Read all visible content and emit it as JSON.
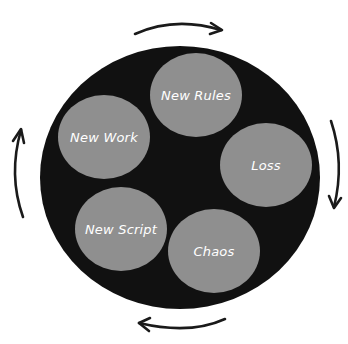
{
  "diagram": {
    "type": "cycle",
    "direction": "clockwise",
    "colors": {
      "background": "#ffffff",
      "outer_circle": "#111111",
      "stage_fill": "#8f8f8f",
      "stage_text": "#ffffff",
      "arrow": "#1a1a1a"
    },
    "stages": [
      {
        "label": "New Rules"
      },
      {
        "label": "Loss"
      },
      {
        "label": "Chaos"
      },
      {
        "label": "New Script"
      },
      {
        "label": "New Work"
      }
    ],
    "arrows": [
      {
        "position": "top",
        "icon": "arrow-right-curved-icon"
      },
      {
        "position": "right",
        "icon": "arrow-down-curved-icon"
      },
      {
        "position": "bottom",
        "icon": "arrow-left-curved-icon"
      },
      {
        "position": "left",
        "icon": "arrow-up-curved-icon"
      }
    ]
  }
}
